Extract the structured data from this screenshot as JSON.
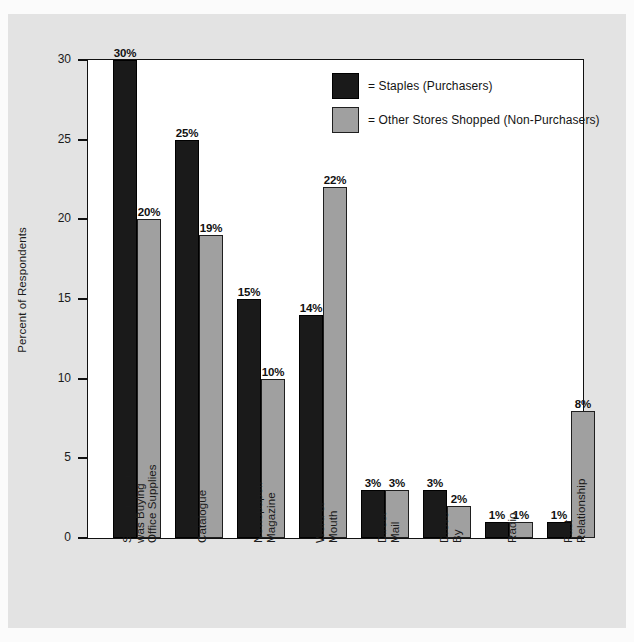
{
  "chart_data": {
    "type": "bar",
    "title": "",
    "subtitle": "",
    "xlabel": "",
    "ylabel": "Percent of Respondents",
    "ylim": [
      0,
      30
    ],
    "yticks": [
      0,
      5,
      10,
      15,
      20,
      25,
      30
    ],
    "ytick_labels": [
      "0",
      "5",
      "10",
      "15",
      "20",
      "25",
      "30"
    ],
    "grid": false,
    "legend_position": "top-right",
    "value_label_suffix": "%",
    "categories": [
      "Saw it in Store/\nwas Buying\nOffice Supplies",
      "Catalogue",
      "Newspaper/\nMagazine",
      "Word of\nMouth",
      "Direct\nMail",
      "Drove\nBy",
      "Radio",
      "Past\nRelationship"
    ],
    "series": [
      {
        "name": "= Staples (Purchasers)",
        "color": "#1a1a1a",
        "values": [
          30,
          25,
          15,
          14,
          3,
          3,
          1,
          1
        ],
        "value_labels": [
          "30%",
          "25%",
          "15%",
          "14%",
          "3%",
          "3%",
          "1%",
          "1%"
        ]
      },
      {
        "name": "= Other Stores Shopped (Non-Purchasers)",
        "color": "#a0a0a0",
        "values": [
          20,
          19,
          10,
          22,
          3,
          2,
          1,
          8
        ],
        "value_labels": [
          "20%",
          "19%",
          "10%",
          "22%",
          "3%",
          "2%",
          "1%",
          "8%"
        ]
      }
    ]
  },
  "colors": {
    "purchasers": "#1a1a1a",
    "non_purchasers": "#a0a0a0",
    "panel_background": "#e3e3e3",
    "plot_background": "#ffffff",
    "axis": "#111111",
    "text": "#1b1b1b"
  }
}
